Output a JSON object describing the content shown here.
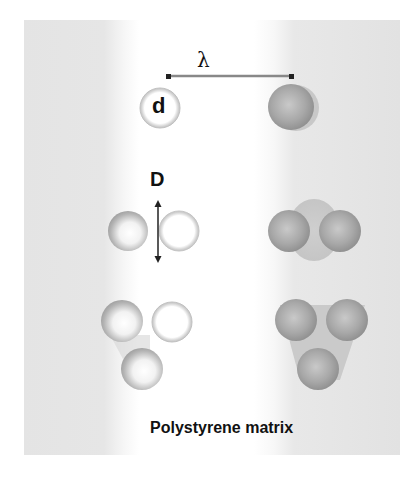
{
  "figure": {
    "labels": {
      "spacing": "λ",
      "particle_diameter": "d",
      "pair_distance": "D",
      "caption": "Polystyrene matrix"
    },
    "colors": {
      "matrix_band": "#e4e4e4",
      "particle_dark": "#9a9a9a",
      "particle_light": "#f2f2f2",
      "halo": "#c8c8c8",
      "text": "#111111"
    },
    "rows": [
      {
        "name": "single",
        "left": "isolated particle (d)",
        "right": "isolated coated particle"
      },
      {
        "name": "dimer",
        "left": "two particles separated by D",
        "right": "fused dimer"
      },
      {
        "name": "trimer",
        "left": "three separated particles",
        "right": "fused trimer"
      }
    ]
  }
}
